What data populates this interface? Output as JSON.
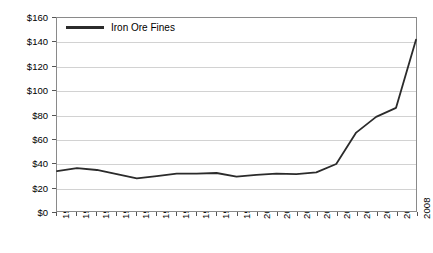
{
  "chart_data": {
    "type": "line",
    "title": "",
    "xlabel": "",
    "ylabel": "US $/Metric Ton",
    "categories": [
      "1990",
      "1991",
      "1992",
      "1993",
      "1994",
      "1995",
      "1996",
      "1997",
      "1998",
      "1999",
      "2000",
      "2001",
      "2002",
      "2003",
      "2004",
      "2005",
      "2006",
      "2007",
      "2008"
    ],
    "series": [
      {
        "name": "Iron Ore Fines",
        "color": "#2b2b2b",
        "values": [
          33,
          35.5,
          34,
          30.5,
          27,
          29,
          31,
          31,
          31.5,
          28.5,
          30,
          31,
          30.5,
          32,
          39,
          65,
          78,
          85.5,
          142
        ]
      }
    ],
    "ylim": [
      0,
      160
    ],
    "ytick_values": [
      0,
      20,
      40,
      60,
      80,
      100,
      120,
      140,
      160
    ],
    "ytick_labels": [
      "$0",
      "$20",
      "$40",
      "$60",
      "$80",
      "$100",
      "$120",
      "$140",
      "$160"
    ],
    "grid": true,
    "legend_position": "top-left"
  },
  "legend": {
    "entries": [
      {
        "label": "Iron Ore Fines"
      }
    ]
  }
}
